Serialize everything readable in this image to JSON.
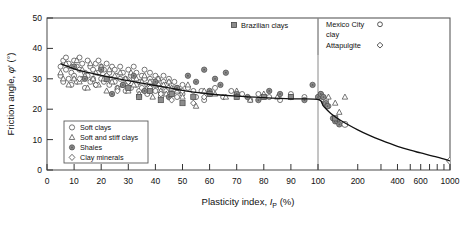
{
  "chart_data": {
    "type": "scatter",
    "title": "",
    "xlabel": "Plasticity index, I_P (%)",
    "ylabel": "Friction angle, φ' (°)",
    "xlabel_parts": {
      "pre": "Plasticity index, ",
      "italic": "I",
      "sub": "P",
      "post": " (%)"
    },
    "ylabel_parts": {
      "pre": "Friction angle, ",
      "italic": "φ",
      "prime": "'",
      "post": " (°)"
    },
    "x_scale": "linear-then-log",
    "x_linear_range": [
      0,
      100
    ],
    "x_log_range": [
      100,
      1000
    ],
    "ylim": [
      0,
      50
    ],
    "y_ticks": [
      0,
      10,
      20,
      30,
      40,
      50
    ],
    "x_ticks_linear": [
      0,
      10,
      20,
      30,
      40,
      50,
      60,
      70,
      80,
      90,
      100
    ],
    "x_ticks_log": [
      200,
      300,
      400,
      500,
      600,
      700,
      800,
      900,
      1000
    ],
    "x_ticklabels_log": [
      200,
      400,
      600,
      1000
    ],
    "grid": false,
    "divider_x": 100,
    "trend_line": [
      [
        5,
        35.0
      ],
      [
        10,
        33.3
      ],
      [
        15,
        32.1
      ],
      [
        20,
        31.1
      ],
      [
        25,
        30.2
      ],
      [
        30,
        29.4
      ],
      [
        35,
        28.6
      ],
      [
        40,
        27.8
      ],
      [
        45,
        27.0
      ],
      [
        50,
        26.2
      ],
      [
        55,
        25.5
      ],
      [
        60,
        25.0
      ],
      [
        70,
        24.3
      ],
      [
        80,
        23.8
      ],
      [
        90,
        23.4
      ],
      [
        100,
        23.2
      ],
      [
        110,
        21.0
      ],
      [
        125,
        18.6
      ],
      [
        150,
        16.2
      ],
      [
        200,
        13.2
      ],
      [
        250,
        11.2
      ],
      [
        300,
        9.8
      ],
      [
        400,
        7.8
      ],
      [
        500,
        6.5
      ],
      [
        600,
        5.6
      ],
      [
        800,
        4.2
      ],
      [
        1000,
        3.0
      ]
    ],
    "series": [
      {
        "name": "Soft clays",
        "marker": "open-circle"
      },
      {
        "name": "Soft and stiff clays",
        "marker": "open-triangle"
      },
      {
        "name": "Shales",
        "marker": "filled-circle"
      },
      {
        "name": "Clay minerals",
        "marker": "open-diamond"
      },
      {
        "name": "Brazilian clays",
        "marker": "filled-square"
      },
      {
        "name": "Mexico City clay",
        "marker": "open-circle"
      },
      {
        "name": "Attapulgite",
        "marker": "open-diamond"
      }
    ],
    "points": {
      "soft_clays": [
        [
          5,
          31
        ],
        [
          5,
          34
        ],
        [
          6,
          36
        ],
        [
          6,
          29
        ],
        [
          7,
          33
        ],
        [
          7,
          37
        ],
        [
          8,
          30
        ],
        [
          8,
          35
        ],
        [
          9,
          32
        ],
        [
          9,
          28
        ],
        [
          10,
          36
        ],
        [
          10,
          31
        ],
        [
          11,
          34
        ],
        [
          11,
          29
        ],
        [
          12,
          33
        ],
        [
          12,
          37
        ],
        [
          13,
          30
        ],
        [
          13,
          35
        ],
        [
          14,
          32
        ],
        [
          14,
          27
        ],
        [
          15,
          36
        ],
        [
          15,
          31
        ],
        [
          16,
          34
        ],
        [
          16,
          29
        ],
        [
          17,
          33
        ],
        [
          17,
          30
        ],
        [
          18,
          35
        ],
        [
          18,
          28
        ],
        [
          19,
          32
        ],
        [
          19,
          36
        ],
        [
          20,
          30
        ],
        [
          20,
          34
        ],
        [
          21,
          29
        ],
        [
          21,
          33
        ],
        [
          22,
          31
        ],
        [
          22,
          35
        ],
        [
          23,
          28
        ],
        [
          23,
          32
        ],
        [
          24,
          30
        ],
        [
          24,
          34
        ],
        [
          25,
          29
        ],
        [
          25,
          33
        ],
        [
          26,
          31
        ],
        [
          26,
          27
        ],
        [
          27,
          30
        ],
        [
          27,
          34
        ],
        [
          28,
          28
        ],
        [
          28,
          32
        ],
        [
          29,
          30
        ],
        [
          29,
          26
        ],
        [
          30,
          29
        ],
        [
          30,
          33
        ],
        [
          31,
          31
        ],
        [
          31,
          27
        ],
        [
          32,
          30
        ],
        [
          32,
          34
        ],
        [
          33,
          28
        ],
        [
          33,
          32
        ],
        [
          34,
          29
        ],
        [
          34,
          26
        ],
        [
          35,
          31
        ],
        [
          35,
          27
        ],
        [
          36,
          30
        ],
        [
          36,
          33
        ],
        [
          37,
          28
        ],
        [
          37,
          25
        ],
        [
          38,
          30
        ],
        [
          38,
          32
        ],
        [
          39,
          27
        ],
        [
          39,
          29
        ],
        [
          40,
          31
        ],
        [
          40,
          26
        ],
        [
          41,
          28
        ],
        [
          41,
          30
        ],
        [
          42,
          27
        ],
        [
          42,
          24
        ],
        [
          43,
          29
        ],
        [
          43,
          31
        ],
        [
          44,
          26
        ],
        [
          44,
          28
        ],
        [
          45,
          27
        ],
        [
          45,
          30
        ],
        [
          46,
          25
        ],
        [
          46,
          28
        ],
        [
          47,
          26
        ],
        [
          47,
          29
        ],
        [
          48,
          24
        ],
        [
          48,
          27
        ],
        [
          49,
          26
        ],
        [
          50,
          28
        ],
        [
          50,
          25
        ],
        [
          52,
          27
        ],
        [
          54,
          26
        ],
        [
          55,
          24
        ],
        [
          57,
          26
        ],
        [
          58,
          23
        ],
        [
          60,
          25
        ],
        [
          62,
          27
        ],
        [
          65,
          24
        ],
        [
          68,
          26
        ],
        [
          72,
          25
        ],
        [
          75,
          23
        ],
        [
          78,
          25
        ],
        [
          82,
          24
        ],
        [
          86,
          23
        ],
        [
          90,
          25
        ],
        [
          95,
          24
        ],
        [
          105,
          25
        ],
        [
          108,
          24
        ],
        [
          112,
          22
        ],
        [
          115,
          23
        ],
        [
          120,
          21
        ]
      ],
      "soft_stiff_clays": [
        [
          5,
          32
        ],
        [
          6,
          30
        ],
        [
          7,
          35
        ],
        [
          8,
          28
        ],
        [
          9,
          34
        ],
        [
          10,
          30
        ],
        [
          11,
          36
        ],
        [
          12,
          29
        ],
        [
          13,
          33
        ],
        [
          14,
          31
        ],
        [
          15,
          27
        ],
        [
          16,
          35
        ],
        [
          17,
          30
        ],
        [
          18,
          32
        ],
        [
          19,
          28
        ],
        [
          20,
          34
        ],
        [
          21,
          30
        ],
        [
          22,
          26
        ],
        [
          23,
          33
        ],
        [
          24,
          29
        ],
        [
          25,
          31
        ],
        [
          26,
          27
        ],
        [
          27,
          32
        ],
        [
          28,
          28
        ],
        [
          29,
          30
        ],
        [
          30,
          26
        ],
        [
          31,
          32
        ],
        [
          32,
          28
        ],
        [
          33,
          30
        ],
        [
          34,
          25
        ],
        [
          35,
          29
        ],
        [
          36,
          31
        ],
        [
          37,
          27
        ],
        [
          38,
          29
        ],
        [
          39,
          24
        ],
        [
          40,
          28
        ],
        [
          41,
          30
        ],
        [
          42,
          26
        ],
        [
          43,
          28
        ],
        [
          44,
          25
        ],
        [
          45,
          29
        ],
        [
          46,
          27
        ],
        [
          48,
          26
        ],
        [
          50,
          24
        ],
        [
          52,
          28
        ],
        [
          55,
          21
        ],
        [
          58,
          26
        ],
        [
          62,
          25
        ],
        [
          66,
          24
        ],
        [
          70,
          26
        ],
        [
          75,
          23
        ],
        [
          80,
          25
        ],
        [
          85,
          24
        ],
        [
          120,
          24
        ],
        [
          135,
          22
        ],
        [
          145,
          19
        ],
        [
          160,
          24
        ]
      ],
      "shales": [
        [
          10,
          34
        ],
        [
          14,
          30
        ],
        [
          20,
          33
        ],
        [
          24,
          25
        ],
        [
          28,
          28
        ],
        [
          32,
          31
        ],
        [
          36,
          26
        ],
        [
          40,
          29
        ],
        [
          45,
          24
        ],
        [
          48,
          27
        ],
        [
          52,
          31
        ],
        [
          55,
          29
        ],
        [
          58,
          33
        ],
        [
          60,
          26
        ],
        [
          62,
          30
        ],
        [
          64,
          28
        ],
        [
          66,
          32
        ],
        [
          70,
          25
        ],
        [
          74,
          24
        ],
        [
          78,
          23
        ],
        [
          82,
          26
        ],
        [
          86,
          25
        ],
        [
          90,
          24
        ],
        [
          95,
          23
        ],
        [
          98,
          28
        ],
        [
          100,
          24
        ],
        [
          105,
          25
        ],
        [
          110,
          24
        ],
        [
          115,
          22
        ],
        [
          118,
          21
        ],
        [
          130,
          17
        ],
        [
          135,
          16
        ],
        [
          140,
          16
        ],
        [
          145,
          15
        ]
      ],
      "clay_minerals": [
        [
          12,
          30
        ],
        [
          18,
          28
        ],
        [
          22,
          31
        ],
        [
          26,
          26
        ],
        [
          30,
          29
        ],
        [
          34,
          24
        ],
        [
          38,
          27
        ],
        [
          42,
          25
        ],
        [
          46,
          23
        ],
        [
          50,
          26
        ],
        [
          54,
          22
        ],
        [
          58,
          24
        ],
        [
          1000,
          3
        ]
      ],
      "brazilian_clays": [
        [
          22,
          30
        ],
        [
          30,
          27
        ],
        [
          34,
          24
        ],
        [
          38,
          26
        ],
        [
          42,
          23
        ],
        [
          46,
          25
        ],
        [
          50,
          22
        ],
        [
          54,
          24
        ],
        [
          60,
          25
        ],
        [
          70,
          24
        ],
        [
          80,
          24
        ],
        [
          90,
          24
        ],
        [
          135,
          17
        ]
      ],
      "mexico_city_clay": [
        [
          160,
          15
        ]
      ],
      "attapulgite": [
        [
          1000,
          3
        ]
      ]
    }
  },
  "legend_inner": {
    "items": [
      {
        "label": "Soft clays",
        "marker": "open-circle"
      },
      {
        "label": "Soft and stiff clays",
        "marker": "open-triangle"
      },
      {
        "label": "Shales",
        "marker": "filled-circle"
      },
      {
        "label": "Clay minerals",
        "marker": "open-diamond"
      }
    ]
  },
  "legend_top_left": {
    "label": "Brazilian clays",
    "marker": "filled-square"
  },
  "legend_top_right": {
    "line1": "Mexico City",
    "line1_marker": "o",
    "line2": "clay",
    "line3": "Attapulgite",
    "line3_marker": "◇"
  },
  "colors": {
    "axis": "#333333",
    "marker_outline": "#444444",
    "marker_fill_gray": "#8b8b8b",
    "trend_line": "#111111",
    "frame": "#5a5a5a",
    "divider": "#8a8a8a"
  }
}
